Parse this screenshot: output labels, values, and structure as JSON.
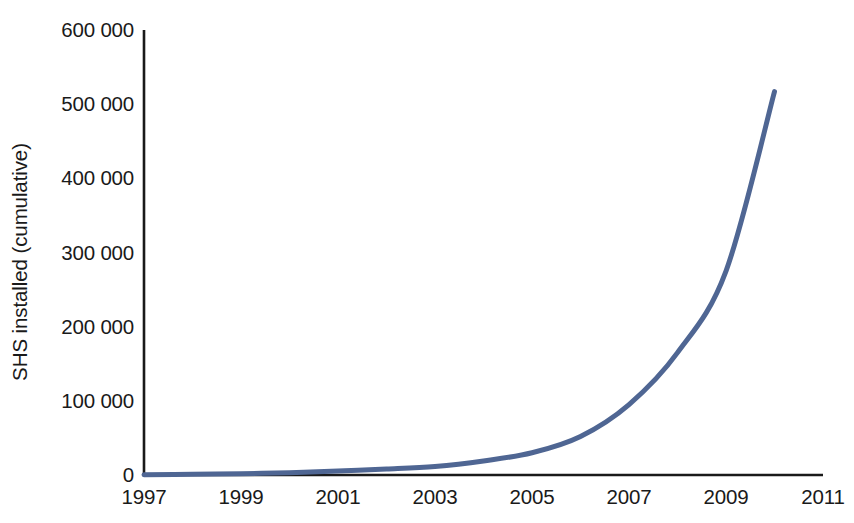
{
  "chart_data": {
    "type": "line",
    "title": "",
    "subtitle": "",
    "xlabel": "",
    "ylabel": "SHS installed (cumulative)",
    "xlim": [
      1997,
      2011
    ],
    "ylim": [
      0,
      600000
    ],
    "grid": false,
    "legend": null,
    "legend_position": "none",
    "line_color": "#4f6693",
    "line_width_px": 5,
    "axis_color": "#1a1a1a",
    "x_tick_labels": [
      "1997",
      "1999",
      "2001",
      "2003",
      "2005",
      "2007",
      "2009",
      "2011"
    ],
    "x_tick_values": [
      1997,
      1999,
      2001,
      2003,
      2005,
      2007,
      2009,
      2011
    ],
    "y_tick_labels": [
      "0",
      "100 000",
      "200 000",
      "300 000",
      "400 000",
      "500 000",
      "600 000"
    ],
    "y_tick_values": [
      0,
      100000,
      200000,
      300000,
      400000,
      500000,
      600000
    ],
    "series": [
      {
        "name": "SHS installed (cumulative)",
        "x": [
          1997,
          1998,
          1999,
          2000,
          2001,
          2002,
          2003,
          2004,
          2005,
          2006,
          2007,
          2008,
          2009,
          2010
        ],
        "values": [
          300,
          900,
          1800,
          3200,
          5500,
          8000,
          11500,
          19000,
          30000,
          52000,
          95000,
          165000,
          275000,
          517000
        ]
      }
    ],
    "annotations": []
  },
  "axis": {
    "y_axis_name": "vertical-axis-line",
    "x_axis_name": "horizontal-axis-line"
  }
}
